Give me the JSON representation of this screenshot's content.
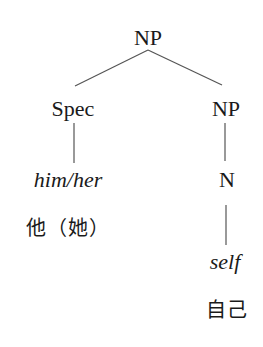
{
  "diagram": {
    "type": "syntax-tree",
    "nodes": {
      "root": {
        "label": "NP"
      },
      "spec": {
        "label": "Spec"
      },
      "np": {
        "label": "NP"
      },
      "spec_word": {
        "label": "him/her"
      },
      "spec_gloss": {
        "label": "他（她）"
      },
      "n": {
        "label": "N"
      },
      "n_word": {
        "label": "self"
      },
      "n_gloss": {
        "label": "自己"
      }
    },
    "edges": [
      {
        "from": "root",
        "to": "spec"
      },
      {
        "from": "root",
        "to": "np"
      },
      {
        "from": "spec",
        "to": "spec_word"
      },
      {
        "from": "np",
        "to": "n"
      },
      {
        "from": "n",
        "to": "n_word"
      }
    ],
    "line_color": "#555555",
    "text_color": "#1a1a1a"
  }
}
